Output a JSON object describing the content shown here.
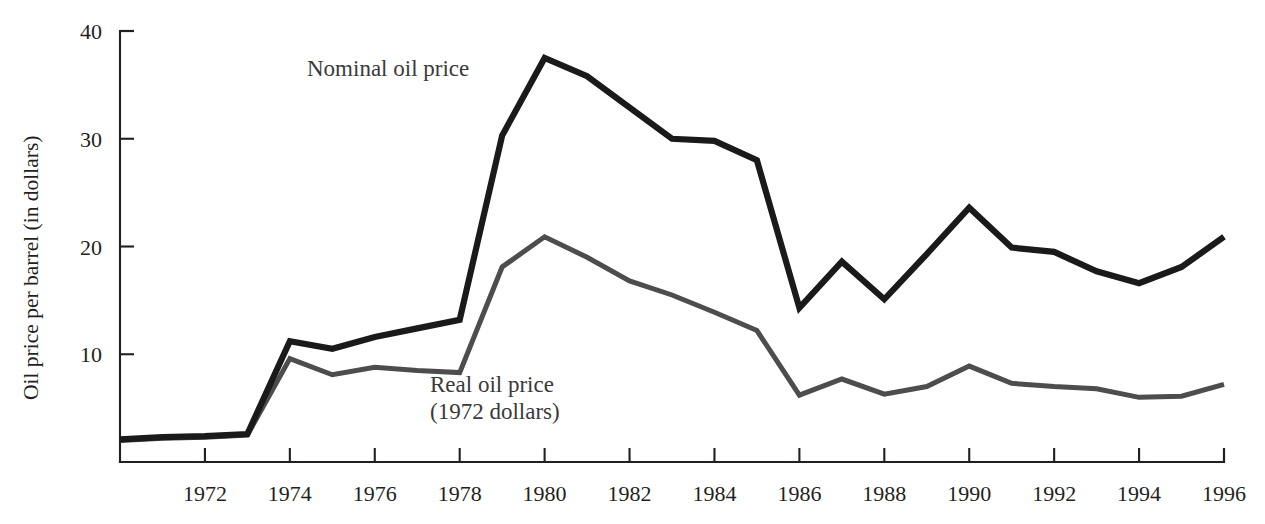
{
  "chart_data": {
    "type": "line",
    "title": "",
    "subtitle": "",
    "xlabel": "",
    "ylabel": "Oil price per barrel (in dollars)",
    "xlim": [
      1970,
      1996
    ],
    "ylim": [
      0,
      40
    ],
    "grid": false,
    "legend_position": "inline-annotations",
    "x": [
      1970,
      1971,
      1972,
      1973,
      1974,
      1975,
      1976,
      1977,
      1978,
      1979,
      1980,
      1981,
      1982,
      1983,
      1984,
      1985,
      1986,
      1987,
      1988,
      1989,
      1990,
      1991,
      1992,
      1993,
      1994,
      1995,
      1996
    ],
    "xticks": [
      1972,
      1974,
      1976,
      1978,
      1980,
      1982,
      1984,
      1986,
      1988,
      1990,
      1992,
      1994,
      1996
    ],
    "xticklabels": [
      "1972",
      "1974",
      "1976",
      "1978",
      "1980",
      "1982",
      "1984",
      "1986",
      "1988",
      "1990",
      "1992",
      "1994",
      "1996"
    ],
    "yticks": [
      10,
      20,
      30,
      40
    ],
    "yticklabels": [
      "10",
      "20",
      "30",
      "40"
    ],
    "series": [
      {
        "name": "Nominal oil price",
        "color": "#1a1a1a",
        "values": [
          2.1,
          2.3,
          2.4,
          2.6,
          11.2,
          10.5,
          11.6,
          12.4,
          13.2,
          30.3,
          37.5,
          35.8,
          32.9,
          30.0,
          29.8,
          28.0,
          14.3,
          18.6,
          15.1,
          19.3,
          23.6,
          19.9,
          19.5,
          17.7,
          16.6,
          18.1,
          20.9
        ]
      },
      {
        "name": "Real oil price (1972 dollars)",
        "color": "#4d4d4d",
        "values": [
          2.0,
          2.2,
          2.3,
          2.5,
          9.6,
          8.1,
          8.8,
          8.5,
          8.3,
          18.1,
          20.9,
          19.0,
          16.8,
          15.5,
          13.9,
          12.2,
          6.2,
          7.7,
          6.3,
          7.0,
          8.9,
          7.3,
          7.0,
          6.8,
          6.0,
          6.1,
          7.2
        ]
      }
    ],
    "annotations": [
      {
        "id": "nominal-label",
        "text": "Nominal oil price",
        "x_px": 307,
        "y_px": 76
      },
      {
        "id": "real-label-line1",
        "text": "Real oil price",
        "x_px": 430,
        "y_px": 392
      },
      {
        "id": "real-label-line2",
        "text": "(1972 dollars)",
        "x_px": 430,
        "y_px": 419
      }
    ]
  }
}
